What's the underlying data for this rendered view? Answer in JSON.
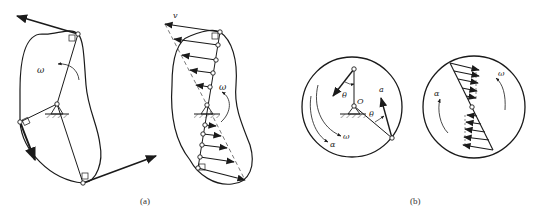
{
  "figure": {
    "panels": [
      {
        "id": "a",
        "caption": "(a)",
        "left_body": {
          "omega_label": "ω"
        },
        "right_body": {
          "velocity_label": "v",
          "omega_label": "ω"
        }
      },
      {
        "id": "b",
        "caption": "(b)",
        "left_disk": {
          "theta_label_1": "θ",
          "theta_label_2": "θ",
          "center_label": "O",
          "acceleration_label": "a",
          "omega_label": "ω",
          "alpha_label": "α"
        },
        "right_disk": {
          "omega_label": "ω",
          "alpha_label": "α"
        }
      }
    ]
  },
  "colors": {
    "ink": "#1a1a1a",
    "dashed": "#555555"
  }
}
